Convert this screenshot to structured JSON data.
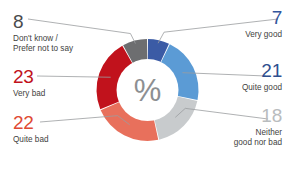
{
  "chart_data": {
    "type": "pie",
    "variant": "donut",
    "title": "",
    "subtitle": "",
    "xlabel": "",
    "ylabel": "",
    "units": "%",
    "center_symbol": "%",
    "grid": false,
    "legend_position": "callout-labels",
    "total": 99,
    "start_angle_deg": 0,
    "direction": "clockwise",
    "categories": [
      "Very good",
      "Quite good",
      "Neither good nor bad",
      "Quite bad",
      "Very bad",
      "Don't know / Prefer not to say"
    ],
    "values": [
      7,
      21,
      18,
      22,
      23,
      8
    ],
    "colors": [
      "#3b5ba5",
      "#5b9bd5",
      "#c8cbcd",
      "#e8705c",
      "#c1121c",
      "#6d6e70"
    ],
    "slices": [
      {
        "label": "Very good",
        "value": 7,
        "color": "#3b5ba5"
      },
      {
        "label": "Quite good",
        "value": 21,
        "color": "#5b9bd5"
      },
      {
        "label": "Neither good nor bad",
        "value": 18,
        "color": "#c8cbcd"
      },
      {
        "label": "Quite bad",
        "value": 22,
        "color": "#e8705c"
      },
      {
        "label": "Very bad",
        "value": 23,
        "color": "#c1121c"
      },
      {
        "label": "Don't know / Prefer not to say",
        "value": 8,
        "color": "#6d6e70"
      }
    ]
  },
  "labels": {
    "dontknow": {
      "value": "8",
      "desc": "Don't know /\nPrefer not to say",
      "color": "#4a4a4c"
    },
    "verybad": {
      "value": "23",
      "desc": "Very bad",
      "color": "#c1121c"
    },
    "quitebad": {
      "value": "22",
      "desc": "Quite bad",
      "color": "#e04a33"
    },
    "verygood": {
      "value": "7",
      "desc": "Very good",
      "color": "#33559c"
    },
    "quitegood": {
      "value": "21",
      "desc": "Quite good",
      "color": "#2f4f8f"
    },
    "neither": {
      "value": "18",
      "desc": "Neither\ngood nor bad",
      "color": "#b9bcbe"
    }
  },
  "center": {
    "symbol": "%",
    "symbol_color": "#8d8f92",
    "disc_color": "#ffffff"
  },
  "style": {
    "background": "#ffffff",
    "leader_line_color": "#9b9da0",
    "slice_gap_color": "#ffffff"
  }
}
